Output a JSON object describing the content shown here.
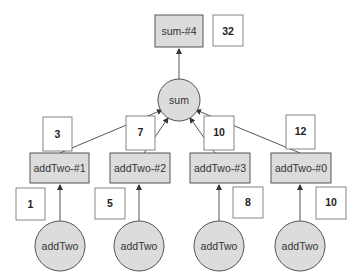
{
  "diagram": {
    "output_node": {
      "label": "sum-#4",
      "value": "32"
    },
    "sum_node": {
      "label": "sum"
    },
    "add_nodes": [
      {
        "label": "addTwo-#1",
        "edge_value": "3",
        "input_value": "1",
        "source_label": "addTwo"
      },
      {
        "label": "addTwo-#2",
        "edge_value": "7",
        "input_value": "5",
        "source_label": "addTwo"
      },
      {
        "label": "addTwo-#3",
        "edge_value": "10",
        "input_value": "8",
        "source_label": "addTwo"
      },
      {
        "label": "addTwo-#0",
        "edge_value": "12",
        "input_value": "10",
        "source_label": "addTwo"
      }
    ],
    "colors": {
      "node_fill": "#dcdcdc",
      "stroke": "#555555",
      "value_fill": "#ffffff"
    }
  }
}
